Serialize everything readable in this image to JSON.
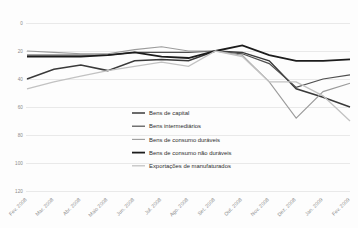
{
  "chart_data": {
    "type": "line",
    "title": "",
    "subtitle": "",
    "xlabel": "",
    "ylabel": "",
    "ylim": [
      0,
      120
    ],
    "yticks": [
      0,
      20,
      40,
      60,
      80,
      100,
      120
    ],
    "grid": true,
    "legend_position": "center",
    "index_base_note": "Set. 2008 = 100",
    "categories": [
      "Fev. 2008",
      "Mar. 2008",
      "Abr. 2008",
      "Maio 2008",
      "Jun. 2008",
      "Jul. 2008",
      "Ago. 2008",
      "Set. 2008",
      "Out. 2008",
      "Nov. 2008",
      "Dez. 2008",
      "Jan. 2009",
      "Fev. 2009"
    ],
    "series": [
      {
        "name": "Bens de capital",
        "color": "#3a3a3a",
        "width": 1.5,
        "values": [
          80,
          87,
          90,
          86,
          93,
          94,
          93,
          100,
          99,
          93,
          73,
          67,
          60
        ]
      },
      {
        "name": "Bens intermediários",
        "color": "#4f4f4f",
        "width": 1.2,
        "values": [
          97,
          97,
          97,
          97,
          99,
          99,
          99,
          100,
          98,
          91,
          74,
          80,
          83
        ]
      },
      {
        "name": "Bens de consumo duráveis",
        "color": "#9b9b9b",
        "width": 1.1,
        "values": [
          100,
          99,
          98,
          98,
          101,
          103,
          100,
          100,
          97,
          78,
          52,
          71,
          77
        ]
      },
      {
        "name": "Bens de consumo não duráveis",
        "color": "#1c1c1c",
        "width": 1.8,
        "values": [
          96,
          96,
          96,
          97,
          99,
          96,
          95,
          100,
          104,
          97,
          93,
          93,
          94
        ]
      },
      {
        "name": "Exportações de manufaturados",
        "color": "#c2c2c2",
        "width": 1.3,
        "values": [
          73,
          78,
          82,
          86,
          89,
          92,
          89,
          100,
          96,
          78,
          78,
          68,
          50
        ]
      }
    ]
  },
  "axes": {
    "y_tick_labels": [
      "120",
      "100",
      "80",
      "60",
      "40",
      "20",
      "0"
    ],
    "x_tick_labels": [
      "Fev. 2008",
      "Mar. 2008",
      "Abr. 2008",
      "Maio 2008",
      "Jun. 2008",
      "Jul. 2008",
      "Ago. 2008",
      "Set. 2008",
      "Out. 2008",
      "Nov. 2008",
      "Dez. 2008",
      "Jan. 2009",
      "Fev. 2009"
    ]
  },
  "legend": {
    "items": [
      {
        "label": "Bens de capital",
        "color": "#3a3a3a",
        "width": 1.5
      },
      {
        "label": "Bens intermediários",
        "color": "#4f4f4f",
        "width": 1.2
      },
      {
        "label": "Bens de consumo duráveis",
        "color": "#9b9b9b",
        "width": 1.1
      },
      {
        "label": "Bens de consumo não duráveis",
        "color": "#1c1c1c",
        "width": 1.8
      },
      {
        "label": "Exportações de manufaturados",
        "color": "#c2c2c2",
        "width": 1.3
      }
    ]
  },
  "style": {
    "grid_color": "#e3e3e3",
    "background": "#fdfdfd",
    "tick_text_color": "#8a8a8a",
    "legend_text_color": "#2e2e2e"
  }
}
